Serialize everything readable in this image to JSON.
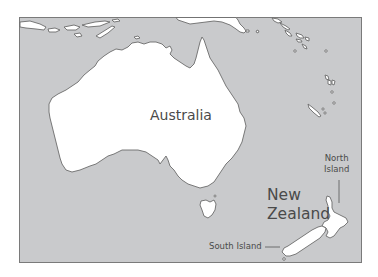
{
  "map": {
    "title": "",
    "colors": {
      "sea": "#c9cacc",
      "land": "#ffffff",
      "coast": "#6b6b6b",
      "frame": "#7a7a7a",
      "text": "#4a4a4a"
    },
    "labels": {
      "australia": "Australia",
      "new_zealand_line1": "New",
      "new_zealand_line2": "Zealand",
      "north_island_line1": "North",
      "north_island_line2": "Island",
      "south_island": "South Island"
    },
    "features": [
      {
        "name": "Australia",
        "type": "continent"
      },
      {
        "name": "Tasmania",
        "type": "island"
      },
      {
        "name": "North Island",
        "type": "island"
      },
      {
        "name": "South Island",
        "type": "island"
      },
      {
        "name": "New Guinea",
        "type": "island"
      },
      {
        "name": "Indonesian islands",
        "type": "island-chain"
      },
      {
        "name": "Pacific islands",
        "type": "island-chain"
      }
    ]
  }
}
